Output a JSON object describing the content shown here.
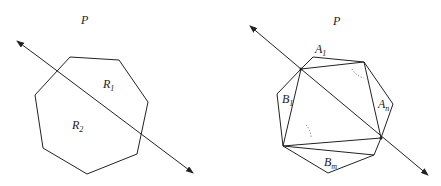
{
  "left_figure": {
    "plane_label": "P",
    "region_labels": [
      {
        "main": "R",
        "sub": "1"
      },
      {
        "main": "R",
        "sub": "2"
      }
    ],
    "shape": "heptagon",
    "line": "bidirectional arrow cutting polygon into two regions"
  },
  "right_figure": {
    "plane_label": "P",
    "region_labels": [
      {
        "main": "A",
        "sub": "1"
      },
      {
        "main": "A",
        "sub": "n"
      },
      {
        "main": "B",
        "sub": "1"
      },
      {
        "main": "B",
        "sub": "m"
      }
    ],
    "shape": "heptagon triangulated",
    "line": "bidirectional arrow through two vertices"
  },
  "colors": {
    "stroke": "#222222",
    "background": "#ffffff"
  }
}
